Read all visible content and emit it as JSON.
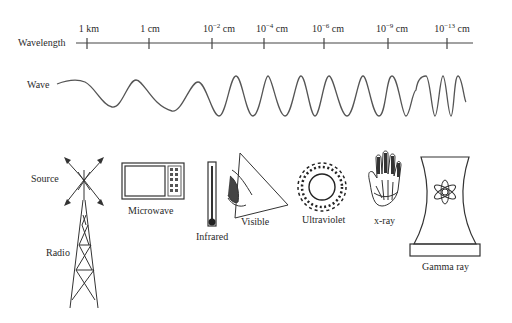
{
  "axis": {
    "title": "Wavelength",
    "ticks": [
      {
        "base": "1 km",
        "exp": "",
        "unit": "",
        "x": 87
      },
      {
        "base": "1 cm",
        "exp": "",
        "unit": "",
        "x": 149
      },
      {
        "base": "10",
        "exp": "−2",
        "unit": " cm",
        "x": 212
      },
      {
        "base": "10",
        "exp": "−4",
        "unit": " cm",
        "x": 264
      },
      {
        "base": "10",
        "exp": "−6",
        "unit": " cm",
        "x": 324
      },
      {
        "base": "10",
        "exp": "−9",
        "unit": " cm",
        "x": 388
      },
      {
        "base": "10",
        "exp": "−13",
        "unit": " cm",
        "x": 447
      }
    ]
  },
  "wave": {
    "label": "Wave"
  },
  "sources": {
    "source_label": "Source",
    "radio": "Radio",
    "microwave": "Microwave",
    "infrared": "Infrared",
    "visible": "Visible",
    "ultraviolet": "Ultraviolet",
    "xray": "x-ray",
    "gamma": "Gamma ray"
  }
}
